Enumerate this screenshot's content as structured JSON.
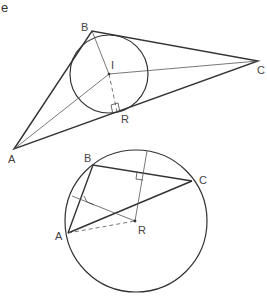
{
  "part_label": "e",
  "figure1": {
    "title": "Incircle of triangle ABC",
    "labels": {
      "A": "A",
      "B": "B",
      "C": "C",
      "I": "I",
      "R": "R"
    },
    "points": {
      "A": [
        14,
        149
      ],
      "B": [
        92,
        31
      ],
      "C": [
        258,
        61
      ],
      "I": [
        109,
        74
      ],
      "R": [
        117,
        112
      ]
    },
    "circle": {
      "center": [
        109,
        74
      ],
      "r": 39
    }
  },
  "figure2": {
    "title": "Circumcircle of triangle ABC",
    "labels": {
      "A": "A",
      "B": "B",
      "C": "C",
      "R": "R"
    },
    "points": {
      "A": [
        68,
        233
      ],
      "B": [
        93,
        165
      ],
      "C": [
        192,
        181
      ],
      "R": [
        135,
        221
      ]
    },
    "circle": {
      "center": [
        136,
        221
      ],
      "r": 71
    }
  }
}
